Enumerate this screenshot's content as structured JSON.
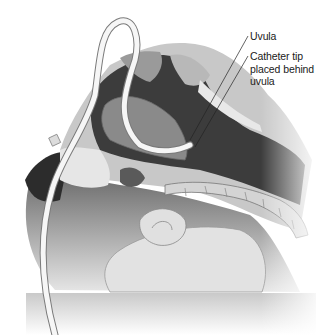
{
  "figure": {
    "labels": [
      {
        "id": "uvula",
        "text": "Uvula"
      },
      {
        "id": "catheter_tip",
        "line1": "Catheter tip",
        "line2": "placed behind",
        "line3": "uvula"
      }
    ],
    "colors": {
      "background": "#ffffff",
      "airway_dark": "#3a3a3a",
      "tissue_mid": "#8a8a8a",
      "tissue_light": "#d8d8d8",
      "catheter": "#f4f4f4",
      "outline": "#555555"
    }
  }
}
